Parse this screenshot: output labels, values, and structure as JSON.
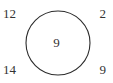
{
  "figure": {
    "type": "circle-number-diagram",
    "background_color": "#ffffff",
    "stroke_color": "#2b2b2b",
    "text_color": "#333333",
    "circle": {
      "center_x": 58,
      "center_y": 43,
      "radius": 32,
      "stroke_width": 1,
      "fill": "none"
    },
    "center_label": {
      "value": "9",
      "position": "center"
    },
    "corner_labels": [
      {
        "position": "top-left",
        "value": "12"
      },
      {
        "position": "top-right",
        "value": "2"
      },
      {
        "position": "bottom-left",
        "value": "14"
      },
      {
        "position": "bottom-right",
        "value": "9"
      }
    ]
  },
  "chart_data": {
    "type": "table",
    "title": "",
    "xlabel": "",
    "ylabel": "",
    "categories": [
      "top-left",
      "top-right",
      "bottom-left",
      "bottom-right",
      "center"
    ],
    "values": [
      12,
      2,
      14,
      9,
      9
    ],
    "annotations": [
      "12",
      "2",
      "14",
      "9",
      "9"
    ],
    "legend": []
  }
}
